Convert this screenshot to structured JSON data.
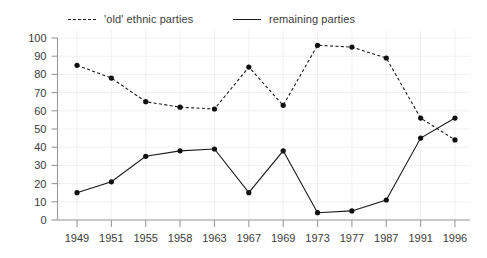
{
  "legend": {
    "position": "top",
    "entries": [
      {
        "label": "'old' ethnic parties",
        "style": "dashed",
        "color": "#1a1a1a"
      },
      {
        "label": "remaining parties",
        "style": "solid",
        "color": "#1a1a1a"
      }
    ]
  },
  "chart_data": {
    "type": "line",
    "title": "",
    "subtitle": "",
    "xlabel": "",
    "ylabel": "",
    "categories": [
      "1949",
      "1951",
      "1955",
      "1958",
      "1963",
      "1967",
      "1969",
      "1973",
      "1977",
      "1987",
      "1991",
      "1996"
    ],
    "series": [
      {
        "name": "'old' ethnic parties",
        "style": "dashed",
        "color": "#1a1a1a",
        "values": [
          85,
          78,
          65,
          62,
          61,
          84,
          63,
          96,
          95,
          89,
          56,
          44
        ]
      },
      {
        "name": "remaining parties",
        "style": "solid",
        "color": "#1a1a1a",
        "values": [
          15,
          21,
          35,
          38,
          39,
          15,
          38,
          4,
          5,
          11,
          45,
          56
        ]
      }
    ],
    "ylim": [
      0,
      100
    ],
    "yticks": [
      0,
      10,
      20,
      30,
      40,
      50,
      60,
      70,
      80,
      90,
      100
    ],
    "ytick_labels": [
      "0",
      "10",
      "20",
      "30",
      "40",
      "50",
      "60",
      "70",
      "80",
      "90",
      "100"
    ],
    "grid": true,
    "grid_color": "#f0f1f3",
    "axis_color": "#9a9a9a",
    "legend_position": "top",
    "marker": "circle"
  }
}
